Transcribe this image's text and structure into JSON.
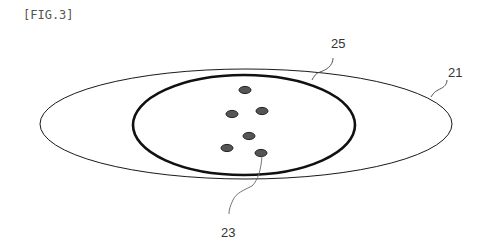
{
  "figure": {
    "label": "[FIG.3]",
    "references": {
      "outer_ellipse": "21",
      "inner_circle": "25",
      "dot": "23"
    },
    "colors": {
      "line": "#1a1a1a",
      "dot_fill": "#555555",
      "text": "#333333"
    },
    "dots": [
      {
        "cx": 245,
        "cy": 90
      },
      {
        "cx": 232,
        "cy": 114
      },
      {
        "cx": 262,
        "cy": 111
      },
      {
        "cx": 249,
        "cy": 136
      },
      {
        "cx": 227,
        "cy": 148
      },
      {
        "cx": 261,
        "cy": 153
      }
    ]
  }
}
